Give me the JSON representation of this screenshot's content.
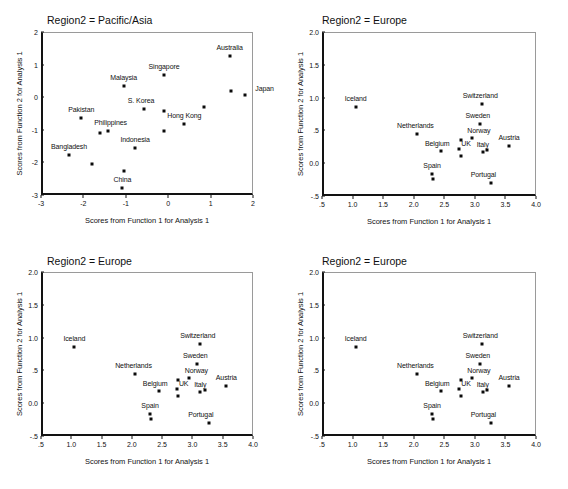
{
  "figure": {
    "background": "#ffffff",
    "point_color": "#0b0b0b",
    "axis_color": "#121212",
    "frame_color": "#9a9a9a",
    "panel_count": 4
  },
  "chart_data": [
    {
      "id": "panel-pacific-asia",
      "type": "scatter",
      "title": "Region2 = Pacific/Asia",
      "xlabel": "Scores from Function 1 for Analysis 1",
      "ylabel": "Scores from Function 2 for Analysis 1",
      "xlim": [
        -3,
        2
      ],
      "ylim": [
        -3,
        2
      ],
      "xticks": [
        "-3",
        "-2",
        "-1",
        "0",
        "1",
        "2"
      ],
      "xtick_values": [
        -3,
        -2,
        -1,
        0,
        1,
        2
      ],
      "yticks": [
        "-3",
        "-2",
        "-1",
        "0",
        "1",
        "2"
      ],
      "ytick_values": [
        -3,
        -2,
        -1,
        0,
        1,
        2
      ],
      "grid": false,
      "legend": "none",
      "points": [
        {
          "label": "Australia",
          "x": 1.45,
          "y": 1.25,
          "label_dx": 0,
          "label_dy": -9
        },
        {
          "label": "Japan",
          "x": 1.8,
          "y": 0.07,
          "label_dx": 20,
          "label_dy": -7
        },
        {
          "label": "",
          "x": 1.48,
          "y": 0.18,
          "label_dx": 0,
          "label_dy": 0
        },
        {
          "label": "Singapore",
          "x": -0.1,
          "y": 0.67,
          "label_dx": 0,
          "label_dy": -9
        },
        {
          "label": "Malaysia",
          "x": -1.05,
          "y": 0.35,
          "label_dx": 0,
          "label_dy": -9
        },
        {
          "label": "",
          "x": 0.85,
          "y": -0.3,
          "label_dx": 0,
          "label_dy": 0
        },
        {
          "label": "S. Korea",
          "x": -0.57,
          "y": -0.35,
          "label_dx": -3,
          "label_dy": -9
        },
        {
          "label": "",
          "x": -0.11,
          "y": -0.41,
          "label_dx": 0,
          "label_dy": 0
        },
        {
          "label": "Hong Kong",
          "x": 0.38,
          "y": -0.82,
          "label_dx": 0,
          "label_dy": -9
        },
        {
          "label": "Pakistan",
          "x": -2.05,
          "y": -0.64,
          "label_dx": 0,
          "label_dy": -9
        },
        {
          "label": "Philippines",
          "x": -1.43,
          "y": -1.05,
          "label_dx": 3,
          "label_dy": -9
        },
        {
          "label": "",
          "x": -1.62,
          "y": -1.1,
          "label_dx": 0,
          "label_dy": 0
        },
        {
          "label": "",
          "x": -0.11,
          "y": -1.03,
          "label_dx": 0,
          "label_dy": 0
        },
        {
          "label": "Indonesia",
          "x": -0.78,
          "y": -1.55,
          "label_dx": 0,
          "label_dy": -9
        },
        {
          "label": "Bangladesh",
          "x": -2.34,
          "y": -1.77,
          "label_dx": 0,
          "label_dy": -9
        },
        {
          "label": "",
          "x": -1.8,
          "y": -2.05,
          "label_dx": 0,
          "label_dy": 0
        },
        {
          "label": "",
          "x": -1.05,
          "y": -2.27,
          "label_dx": 0,
          "label_dy": 0
        },
        {
          "label": "China",
          "x": -1.08,
          "y": -2.78,
          "label_dx": 0,
          "label_dy": -9
        }
      ]
    },
    {
      "id": "panel-europe-1",
      "type": "scatter",
      "title": "Region2 = Europe",
      "xlabel": "Scores from Function 1 for Analysis 1",
      "ylabel": "Scores from Function 2 for Analysis 1",
      "xlim": [
        0.5,
        4.0
      ],
      "ylim": [
        -0.5,
        2.0
      ],
      "xticks": [
        ".5",
        "1.0",
        "1.5",
        "2.0",
        "2.5",
        "3.0",
        "3.5",
        "4.0"
      ],
      "xtick_values": [
        0.5,
        1.0,
        1.5,
        2.0,
        2.5,
        3.0,
        3.5,
        4.0
      ],
      "yticks": [
        "-.5",
        "0.0",
        ".5",
        "1.0",
        "1.5",
        "2.0"
      ],
      "ytick_values": [
        -0.5,
        0.0,
        0.5,
        1.0,
        1.5,
        2.0
      ],
      "grid": false,
      "legend": "none",
      "points": [
        {
          "label": "Iceland",
          "x": 1.05,
          "y": 0.86,
          "label_dx": 0,
          "label_dy": -9
        },
        {
          "label": "Switzerland",
          "x": 3.12,
          "y": 0.9,
          "label_dx": -2,
          "label_dy": -9
        },
        {
          "label": "Sweden",
          "x": 3.08,
          "y": 0.59,
          "label_dx": -2,
          "label_dy": -9
        },
        {
          "label": "Netherlands",
          "x": 2.06,
          "y": 0.45,
          "label_dx": -2,
          "label_dy": -9
        },
        {
          "label": "Norway",
          "x": 2.95,
          "y": 0.39,
          "label_dx": 7,
          "label_dy": -8
        },
        {
          "label": "",
          "x": 2.77,
          "y": 0.36,
          "label_dx": 0,
          "label_dy": 0
        },
        {
          "label": "Austria",
          "x": 3.56,
          "y": 0.26,
          "label_dx": 0,
          "label_dy": -9
        },
        {
          "label": "Belgium",
          "x": 2.45,
          "y": 0.19,
          "label_dx": -4,
          "label_dy": -8
        },
        {
          "label": "Italy",
          "x": 3.13,
          "y": 0.17,
          "label_dx": 0,
          "label_dy": -8
        },
        {
          "label": "",
          "x": 3.2,
          "y": 0.2,
          "label_dx": 0,
          "label_dy": 0
        },
        {
          "label": "UK",
          "x": 2.74,
          "y": 0.21,
          "label_dx": 7,
          "label_dy": -6
        },
        {
          "label": "",
          "x": 2.77,
          "y": 0.11,
          "label_dx": 0,
          "label_dy": 0
        },
        {
          "label": "Spain",
          "x": 2.3,
          "y": -0.17,
          "label_dx": 0,
          "label_dy": -9
        },
        {
          "label": "",
          "x": 2.32,
          "y": -0.24,
          "label_dx": 0,
          "label_dy": 0
        },
        {
          "label": "Portugal",
          "x": 3.27,
          "y": -0.3,
          "label_dx": -8,
          "label_dy": -9
        }
      ]
    },
    {
      "id": "panel-europe-2",
      "type": "scatter",
      "title": "Region2 = Europe",
      "xlabel": "Scores from Function 1 for Analysis 1",
      "ylabel": "Scores from Function 2 for Analysis 1",
      "xlim": [
        0.5,
        4.0
      ],
      "ylim": [
        -0.5,
        2.0
      ],
      "xticks": [
        ".5",
        "1.0",
        "1.5",
        "2.0",
        "2.5",
        "3.0",
        "3.5",
        "4.0"
      ],
      "xtick_values": [
        0.5,
        1.0,
        1.5,
        2.0,
        2.5,
        3.0,
        3.5,
        4.0
      ],
      "yticks": [
        "-.5",
        "0.0",
        ".5",
        "1.0",
        "1.5",
        "2.0"
      ],
      "ytick_values": [
        -0.5,
        0.0,
        0.5,
        1.0,
        1.5,
        2.0
      ],
      "grid": false,
      "legend": "none",
      "points": [
        {
          "label": "Iceland",
          "x": 1.05,
          "y": 0.86,
          "label_dx": 0,
          "label_dy": -9
        },
        {
          "label": "Switzerland",
          "x": 3.12,
          "y": 0.9,
          "label_dx": -2,
          "label_dy": -9
        },
        {
          "label": "Sweden",
          "x": 3.08,
          "y": 0.59,
          "label_dx": -2,
          "label_dy": -9
        },
        {
          "label": "Netherlands",
          "x": 2.06,
          "y": 0.45,
          "label_dx": -2,
          "label_dy": -9
        },
        {
          "label": "Norway",
          "x": 2.95,
          "y": 0.39,
          "label_dx": 7,
          "label_dy": -8
        },
        {
          "label": "",
          "x": 2.77,
          "y": 0.36,
          "label_dx": 0,
          "label_dy": 0
        },
        {
          "label": "Austria",
          "x": 3.56,
          "y": 0.26,
          "label_dx": 0,
          "label_dy": -9
        },
        {
          "label": "Belgium",
          "x": 2.45,
          "y": 0.19,
          "label_dx": -4,
          "label_dy": -8
        },
        {
          "label": "Italy",
          "x": 3.13,
          "y": 0.17,
          "label_dx": 0,
          "label_dy": -8
        },
        {
          "label": "",
          "x": 3.2,
          "y": 0.2,
          "label_dx": 0,
          "label_dy": 0
        },
        {
          "label": "UK",
          "x": 2.74,
          "y": 0.21,
          "label_dx": 7,
          "label_dy": -6
        },
        {
          "label": "",
          "x": 2.77,
          "y": 0.11,
          "label_dx": 0,
          "label_dy": 0
        },
        {
          "label": "Spain",
          "x": 2.3,
          "y": -0.17,
          "label_dx": 0,
          "label_dy": -9
        },
        {
          "label": "",
          "x": 2.32,
          "y": -0.24,
          "label_dx": 0,
          "label_dy": 0
        },
        {
          "label": "Portugal",
          "x": 3.27,
          "y": -0.3,
          "label_dx": -8,
          "label_dy": -9
        }
      ]
    },
    {
      "id": "panel-europe-3",
      "type": "scatter",
      "title": "Region2 = Europe",
      "xlabel": "Scores from Function 1 for Analysis 1",
      "ylabel": "Scores from Function 2 for Analysis 1",
      "xlim": [
        0.5,
        4.0
      ],
      "ylim": [
        -0.5,
        2.0
      ],
      "xticks": [
        ".5",
        "1.0",
        "1.5",
        "2.0",
        "2.5",
        "3.0",
        "3.5",
        "4.0"
      ],
      "xtick_values": [
        0.5,
        1.0,
        1.5,
        2.0,
        2.5,
        3.0,
        3.5,
        4.0
      ],
      "yticks": [
        "-.5",
        "0.0",
        ".5",
        "1.0",
        "1.5",
        "2.0"
      ],
      "ytick_values": [
        -0.5,
        0.0,
        0.5,
        1.0,
        1.5,
        2.0
      ],
      "grid": false,
      "legend": "none",
      "points": [
        {
          "label": "Iceland",
          "x": 1.05,
          "y": 0.86,
          "label_dx": 0,
          "label_dy": -9
        },
        {
          "label": "Switzerland",
          "x": 3.12,
          "y": 0.9,
          "label_dx": -2,
          "label_dy": -9
        },
        {
          "label": "Sweden",
          "x": 3.08,
          "y": 0.59,
          "label_dx": -2,
          "label_dy": -9
        },
        {
          "label": "Netherlands",
          "x": 2.06,
          "y": 0.45,
          "label_dx": -2,
          "label_dy": -9
        },
        {
          "label": "Norway",
          "x": 2.95,
          "y": 0.39,
          "label_dx": 7,
          "label_dy": -8
        },
        {
          "label": "",
          "x": 2.77,
          "y": 0.36,
          "label_dx": 0,
          "label_dy": 0
        },
        {
          "label": "Austria",
          "x": 3.56,
          "y": 0.26,
          "label_dx": 0,
          "label_dy": -9
        },
        {
          "label": "Belgium",
          "x": 2.45,
          "y": 0.19,
          "label_dx": -4,
          "label_dy": -8
        },
        {
          "label": "Italy",
          "x": 3.13,
          "y": 0.17,
          "label_dx": 0,
          "label_dy": -8
        },
        {
          "label": "",
          "x": 3.2,
          "y": 0.2,
          "label_dx": 0,
          "label_dy": 0
        },
        {
          "label": "UK",
          "x": 2.74,
          "y": 0.21,
          "label_dx": 7,
          "label_dy": -6
        },
        {
          "label": "",
          "x": 2.77,
          "y": 0.11,
          "label_dx": 0,
          "label_dy": 0
        },
        {
          "label": "Spain",
          "x": 2.3,
          "y": -0.17,
          "label_dx": 0,
          "label_dy": -9
        },
        {
          "label": "",
          "x": 2.32,
          "y": -0.24,
          "label_dx": 0,
          "label_dy": 0
        },
        {
          "label": "Portugal",
          "x": 3.27,
          "y": -0.3,
          "label_dx": -8,
          "label_dy": -9
        }
      ]
    }
  ]
}
